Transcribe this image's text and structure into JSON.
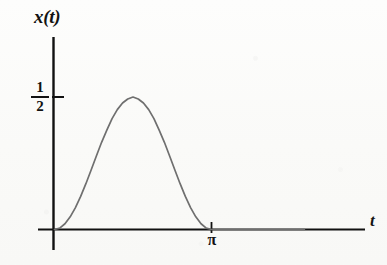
{
  "figure": {
    "background_color": "#fbfbf9",
    "ink_color": "#111111",
    "curve_color": "#6f6f6f"
  },
  "labels": {
    "y_axis": "x(t)",
    "x_axis": "t",
    "y_tick_numerator": "1",
    "y_tick_denominator": "2",
    "x_tick_pi": "π"
  },
  "chart_data": {
    "type": "line",
    "title": "",
    "xlabel": "t",
    "ylabel": "x(t)",
    "xlim": [
      0,
      5.05
    ],
    "ylim": [
      0,
      0.82
    ],
    "grid": false,
    "legend": "none",
    "xticks": [
      3.14159
    ],
    "xticklabels": [
      "π"
    ],
    "yticks": [
      0.5
    ],
    "yticklabels": [
      "1/2"
    ],
    "annotations": [
      "curve rises from 0 at t=0 to a maximum of 1/2 at t=pi/2 and returns to 0 at t=pi",
      "curve is flat (zero) for t greater than pi"
    ],
    "series": [
      {
        "name": "x(t) = sin^2(t)",
        "color": "#6f6f6f",
        "x": [
          0.0,
          0.1047,
          0.2094,
          0.3142,
          0.4189,
          0.5236,
          0.6283,
          0.733,
          0.8378,
          0.9425,
          1.0472,
          1.1519,
          1.2566,
          1.3614,
          1.4661,
          1.5708,
          1.6755,
          1.7802,
          1.885,
          1.9897,
          2.0944,
          2.1991,
          2.3038,
          2.4086,
          2.5133,
          2.618,
          2.7227,
          2.8274,
          2.9322,
          3.0369,
          3.1416,
          3.5,
          4.0,
          4.5,
          5.0
        ],
        "y": [
          0.0,
          0.0054,
          0.0216,
          0.0477,
          0.0826,
          0.125,
          0.1729,
          0.2244,
          0.2772,
          0.329,
          0.375,
          0.4186,
          0.4524,
          0.4773,
          0.4924,
          0.5,
          0.4924,
          0.4773,
          0.4524,
          0.4186,
          0.375,
          0.329,
          0.2772,
          0.2244,
          0.1729,
          0.125,
          0.0826,
          0.0477,
          0.0216,
          0.0054,
          0.0,
          0.0,
          0.0,
          0.0,
          0.0
        ]
      }
    ]
  }
}
